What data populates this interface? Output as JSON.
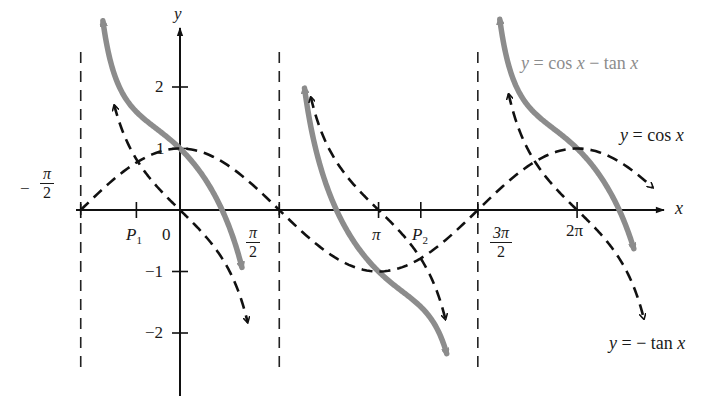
{
  "chart_data": {
    "type": "line",
    "title": "",
    "xlabel": "x",
    "ylabel": "y",
    "xlim": [
      -1.6,
      7.6
    ],
    "ylim": [
      -2.9,
      2.9
    ],
    "grid": false,
    "legend_position": "inline annotations",
    "x_ticks": [
      {
        "value": -1.5708,
        "label": "−π/2",
        "num": "π",
        "den": "2",
        "neg": true
      },
      {
        "value": -0.69,
        "label": "P1"
      },
      {
        "value": 0,
        "label": "0"
      },
      {
        "value": 1.5708,
        "label": "π/2",
        "num": "π",
        "den": "2"
      },
      {
        "value": 3.1416,
        "label": "π"
      },
      {
        "value": 3.81,
        "label": "P2"
      },
      {
        "value": 4.7124,
        "label": "3π/2",
        "num": "3π",
        "den": "2"
      },
      {
        "value": 6.2832,
        "label": "2π"
      }
    ],
    "y_ticks": [
      {
        "value": 2,
        "label": "2"
      },
      {
        "value": 1,
        "label": "1"
      },
      {
        "value": -1,
        "label": "−1"
      },
      {
        "value": -2,
        "label": "−2"
      }
    ],
    "asymptotes_x": [
      -1.5708,
      1.5708,
      4.7124
    ],
    "series": [
      {
        "name": "y = cos x",
        "style": "dashed",
        "color": "#111111",
        "function": "cos",
        "segments": [
          [
            -1.5708,
            7.48
          ]
        ],
        "key_points": [
          [
            -1.5708,
            0
          ],
          [
            0,
            1
          ],
          [
            1.5708,
            0
          ],
          [
            3.1416,
            -1
          ],
          [
            4.7124,
            0
          ],
          [
            6.2832,
            1
          ]
        ]
      },
      {
        "name": "y = − tan x",
        "style": "dashed",
        "color": "#111111",
        "function": "-tan",
        "segments": [
          [
            -1.04,
            1.07
          ],
          [
            2.07,
            4.2
          ],
          [
            5.2,
            7.34
          ]
        ],
        "key_points": [
          [
            0,
            0
          ],
          [
            3.1416,
            0
          ],
          [
            6.2832,
            0
          ]
        ]
      },
      {
        "name": "y = cos x − tan x",
        "style": "solid",
        "color": "#8c8c8c",
        "function": "cos-tan",
        "segments": [
          [
            -1.22,
            0.98
          ],
          [
            1.97,
            4.22
          ],
          [
            5.06,
            7.18
          ]
        ],
        "key_points": [
          [
            0,
            1
          ],
          [
            -0.69,
            0.77
          ],
          [
            3.81,
            -0.79
          ]
        ]
      }
    ],
    "annotations": [
      {
        "text": "y = cos x − tan x",
        "color": "#8c8c8c"
      },
      {
        "text": "y = cos x",
        "color": "#111111"
      },
      {
        "text": "y = − tan x",
        "color": "#111111"
      }
    ],
    "points_of_intersection": [
      {
        "label": "P1",
        "x": -0.69
      },
      {
        "label": "P2",
        "x": 3.81
      }
    ]
  },
  "labels": {
    "y_axis": "y",
    "x_axis": "x",
    "origin": "0",
    "y2": "2",
    "y1": "1",
    "ym1": "−1",
    "ym2": "−2",
    "neg_pi_half_minus": "−",
    "pi": "π",
    "two": "2",
    "three_pi": "3π",
    "pi_tick": "π",
    "two_pi": "2π",
    "p1": "P",
    "p1_sub": "1",
    "p2": "P",
    "p2_sub": "2",
    "ann_gray": "y = cos x − tan x",
    "ann_cos": "y = cos x",
    "ann_tan": "y = − tan x"
  }
}
